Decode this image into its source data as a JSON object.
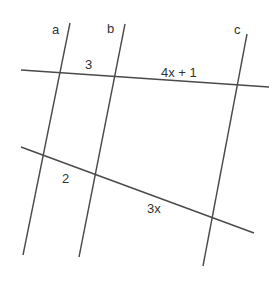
{
  "diagram": {
    "type": "parallel lines cut by transversals",
    "colors": {
      "line": "#4a4a4a",
      "text": "#333333",
      "background": "#ffffff"
    },
    "lines": {
      "a": {
        "label": "a"
      },
      "b": {
        "label": "b"
      },
      "c": {
        "label": "c"
      }
    },
    "segments": {
      "upper_ab": "3",
      "upper_bc": "4x + 1",
      "lower_ab": "2",
      "lower_bc": "3x"
    }
  }
}
